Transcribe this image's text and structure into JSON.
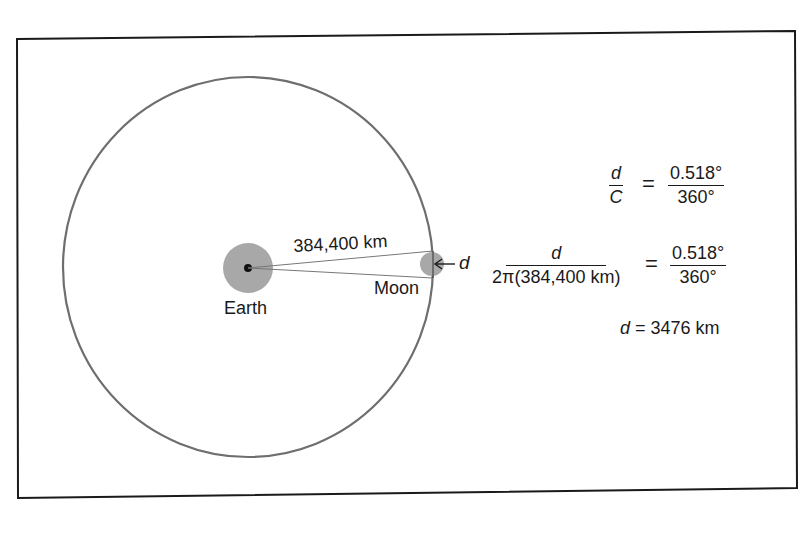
{
  "diagram": {
    "colors": {
      "frame": "#1a1a1a",
      "orbit": "#6e6e6e",
      "body_fill": "#a8a8a8",
      "earth_center": "#111111",
      "sight_line": "#777777",
      "text": "#1a1a1a"
    },
    "labels": {
      "distance": "384,400 km",
      "earth": "Earth",
      "moon": "Moon",
      "d_marker": "d"
    },
    "equations": {
      "eq1": {
        "lhs_num": "d",
        "lhs_den": "C",
        "equals": "=",
        "rhs_num": "0.518°",
        "rhs_den": "360°"
      },
      "eq2": {
        "lhs_num": "d",
        "lhs_den": "2π(384,400 km)",
        "equals": "=",
        "rhs_num": "0.518°",
        "rhs_den": "360°"
      },
      "result": {
        "var": "d",
        "equals": " = ",
        "value": "3476 km"
      }
    }
  }
}
